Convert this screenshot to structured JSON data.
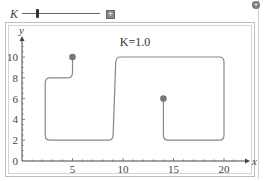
{
  "controls": {
    "slider": {
      "label": "K",
      "value": 1.0,
      "thumb_fraction": 0.2
    },
    "plus_button_label": "+",
    "corner_button_label": "+"
  },
  "chart_data": {
    "type": "line",
    "title": "K=1.0",
    "xlabel": "x",
    "ylabel": "y",
    "xlim": [
      0,
      22
    ],
    "ylim": [
      0,
      11
    ],
    "x_ticks": [
      5,
      10,
      15,
      20
    ],
    "y_ticks": [
      0,
      2,
      4,
      6,
      8,
      10
    ],
    "grid": false,
    "series": [
      {
        "name": "path",
        "color": "#888888",
        "points": [
          [
            5,
            10
          ],
          [
            5,
            8
          ],
          [
            2.3,
            8
          ],
          [
            2.3,
            2
          ],
          [
            9,
            2
          ],
          [
            9.3,
            10
          ],
          [
            20,
            10
          ],
          [
            20,
            2
          ],
          [
            14,
            2
          ],
          [
            14,
            6
          ]
        ]
      }
    ],
    "markers": [
      {
        "label": "start",
        "x": 5,
        "y": 10,
        "color": "#777777"
      },
      {
        "label": "end",
        "x": 14,
        "y": 6,
        "color": "#777777"
      }
    ]
  }
}
